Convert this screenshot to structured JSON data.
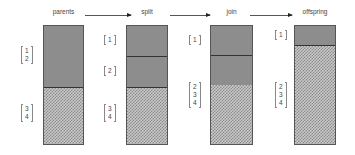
{
  "stages": [
    {
      "label": "parents"
    },
    {
      "label": "split"
    },
    {
      "label": "join"
    },
    {
      "label": "offspring"
    }
  ],
  "brackets": {
    "parents_top": [
      "1",
      "2"
    ],
    "parents_bottom": [
      "3",
      "4"
    ],
    "split_a": [
      "1"
    ],
    "split_b": [
      "2"
    ],
    "split_bottom": [
      "3",
      "4"
    ],
    "join_top": [
      "1"
    ],
    "join_bottom": [
      "2",
      "3",
      "4"
    ],
    "offspring_top": [
      "1"
    ],
    "offspring_bottom": [
      "2",
      "3",
      "4"
    ]
  },
  "colors": {
    "solid_fill": "#8d8d8d",
    "pattern_fill": "#c8c8c8",
    "outline": "#555555"
  }
}
